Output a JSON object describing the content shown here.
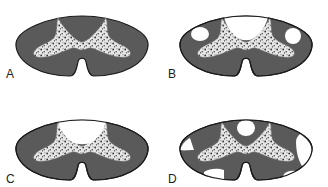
{
  "figure": {
    "colors": {
      "white_matter": "#5a5a5a",
      "outline": "#1a1a1a",
      "gray_matter_fill": "#e8e8e8",
      "gray_matter_speckle": "#333333",
      "lesion": "#ffffff",
      "background": "#ffffff"
    },
    "panels": [
      {
        "label": "A",
        "lesions": []
      },
      {
        "label": "B",
        "lesions": [
          "dorsal-columns",
          "left-lateral-round",
          "right-lateral-round"
        ]
      },
      {
        "label": "C",
        "lesions": [
          "dorsal-columns"
        ]
      },
      {
        "label": "D",
        "lesions": [
          "dorsal-central-oval",
          "left-lateral-patch",
          "left-ventral-patch",
          "right-lateral-patch",
          "right-ventral-patch"
        ]
      }
    ]
  }
}
